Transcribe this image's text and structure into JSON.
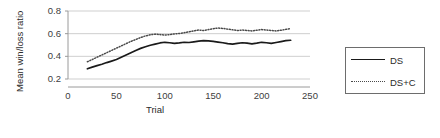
{
  "chart_data": {
    "type": "line",
    "title": "",
    "xlabel": "Trial",
    "ylabel": "Mean win/loss ratio",
    "xlim": [
      0,
      250
    ],
    "ylim": [
      0.2,
      0.8
    ],
    "xticks": [
      "0",
      "50",
      "100",
      "150",
      "200",
      "250"
    ],
    "xtick_values": [
      0,
      50,
      100,
      150,
      200,
      250
    ],
    "yticks": [
      "0.2",
      "0.4",
      "0.6",
      "0.8"
    ],
    "ytick_values": [
      0.2,
      0.4,
      0.6,
      0.8
    ],
    "grid": "horizontal",
    "legend_position": "right-outside",
    "x": [
      20,
      25,
      30,
      35,
      40,
      45,
      50,
      55,
      60,
      65,
      70,
      75,
      80,
      85,
      90,
      95,
      100,
      105,
      110,
      115,
      120,
      125,
      130,
      135,
      140,
      145,
      150,
      155,
      160,
      165,
      170,
      175,
      180,
      185,
      190,
      195,
      200,
      205,
      210,
      215,
      220,
      225,
      230
    ],
    "series": [
      {
        "name": "DS",
        "style": "solid",
        "color": "#1a1a1a",
        "values": [
          0.29,
          0.305,
          0.318,
          0.33,
          0.345,
          0.358,
          0.372,
          0.392,
          0.412,
          0.432,
          0.452,
          0.47,
          0.484,
          0.498,
          0.508,
          0.518,
          0.524,
          0.52,
          0.514,
          0.518,
          0.524,
          0.522,
          0.528,
          0.534,
          0.538,
          0.536,
          0.532,
          0.526,
          0.52,
          0.512,
          0.508,
          0.514,
          0.52,
          0.516,
          0.51,
          0.516,
          0.524,
          0.52,
          0.514,
          0.522,
          0.53,
          0.538,
          0.542
        ]
      },
      {
        "name": "DS+C",
        "style": "dotted",
        "color": "#4a4a4a",
        "values": [
          0.352,
          0.372,
          0.392,
          0.412,
          0.432,
          0.452,
          0.472,
          0.492,
          0.512,
          0.532,
          0.548,
          0.566,
          0.58,
          0.59,
          0.596,
          0.592,
          0.588,
          0.592,
          0.598,
          0.602,
          0.608,
          0.616,
          0.624,
          0.632,
          0.628,
          0.636,
          0.644,
          0.65,
          0.646,
          0.64,
          0.634,
          0.628,
          0.632,
          0.628,
          0.624,
          0.63,
          0.636,
          0.632,
          0.628,
          0.624,
          0.63,
          0.638,
          0.644
        ]
      }
    ]
  },
  "legend": {
    "entries": [
      {
        "label": "DS"
      },
      {
        "label": "DS+C"
      }
    ]
  }
}
